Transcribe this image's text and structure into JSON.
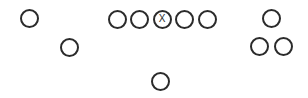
{
  "diagram": {
    "width": 308,
    "height": 98,
    "background_color": "#ffffff",
    "marker_stroke_color": "#2b2b2b",
    "marker_fill_color": "#ffffff",
    "marker_stroke_width": 2,
    "marker_diameter": 19,
    "label_color": "#2b2b2b",
    "label_font_size": 10,
    "markers": [
      {
        "name": "player-left-wide-receiver",
        "label": "",
        "x": 19.5,
        "y": 9,
        "diameter": 19,
        "group": "left-perimeter"
      },
      {
        "name": "player-left-slot",
        "label": "",
        "x": 60,
        "y": 37.5,
        "diameter": 19,
        "group": "left-perimeter"
      },
      {
        "name": "player-left-tackle",
        "label": "",
        "x": 107.5,
        "y": 9.5,
        "diameter": 19,
        "group": "offensive-line"
      },
      {
        "name": "player-left-guard",
        "label": "",
        "x": 130,
        "y": 9.5,
        "diameter": 19,
        "group": "offensive-line"
      },
      {
        "name": "player-center",
        "label": "X",
        "x": 152.5,
        "y": 9.5,
        "diameter": 19,
        "group": "offensive-line"
      },
      {
        "name": "player-right-guard",
        "label": "",
        "x": 175,
        "y": 9.5,
        "diameter": 19,
        "group": "offensive-line"
      },
      {
        "name": "player-right-tackle",
        "label": "",
        "x": 198,
        "y": 9.5,
        "diameter": 19,
        "group": "offensive-line"
      },
      {
        "name": "player-right-wide-receiver",
        "label": "",
        "x": 262,
        "y": 9,
        "diameter": 19,
        "group": "right-perimeter"
      },
      {
        "name": "player-right-slot-inside",
        "label": "",
        "x": 250,
        "y": 37,
        "diameter": 19,
        "group": "right-perimeter"
      },
      {
        "name": "player-right-slot-outside",
        "label": "",
        "x": 274,
        "y": 37,
        "diameter": 19,
        "group": "right-perimeter"
      },
      {
        "name": "player-backfield",
        "label": "",
        "x": 151,
        "y": 72,
        "diameter": 19,
        "group": "backfield"
      }
    ]
  }
}
